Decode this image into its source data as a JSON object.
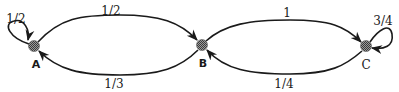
{
  "diagram": {
    "type": "markov-chain",
    "nodes": [
      {
        "id": "A",
        "label": "A",
        "x": 34,
        "y": 46
      },
      {
        "id": "B",
        "label": "B",
        "x": 202,
        "y": 45
      },
      {
        "id": "C",
        "label": "C",
        "x": 366,
        "y": 46
      }
    ],
    "edges": [
      {
        "from": "A",
        "to": "A",
        "label": "1/2",
        "kind": "self-loop"
      },
      {
        "from": "A",
        "to": "B",
        "label": "1/2",
        "kind": "upper-arc"
      },
      {
        "from": "B",
        "to": "A",
        "label": "1/3",
        "kind": "lower-arc"
      },
      {
        "from": "B",
        "to": "C",
        "label": "1",
        "kind": "upper-arc"
      },
      {
        "from": "C",
        "to": "B",
        "label": "1/4",
        "kind": "lower-arc"
      },
      {
        "from": "C",
        "to": "C",
        "label": "3/4",
        "kind": "self-loop"
      }
    ],
    "colors": {
      "stroke": "#1a1a1a",
      "node_fill": "#7a7a7a",
      "background": "#ffffff"
    }
  }
}
